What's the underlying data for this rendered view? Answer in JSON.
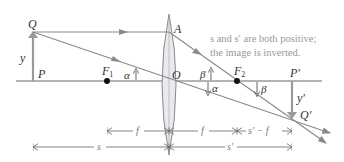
{
  "diagram": {
    "note_lines": [
      "s and s′ are both positive;",
      "the image is inverted."
    ],
    "points": {
      "Q": "Q",
      "P": "P",
      "F1": "F",
      "F1_sub": "1",
      "O": "O",
      "A": "A",
      "F2": "F",
      "F2_sub": "2",
      "P_prime": "P′",
      "Q_prime": "Q′"
    },
    "heights": {
      "object": "y",
      "image": "y′"
    },
    "angles": {
      "alpha_left": "α",
      "beta_upper": "β",
      "alpha_right": "α",
      "beta_lower": "β"
    },
    "dimensions": {
      "row1": [
        "f",
        "f",
        "s′ − f"
      ],
      "row2": [
        "s",
        "s′"
      ]
    },
    "colors": {
      "ray": "#8a8a8a",
      "axis": "#666666",
      "lens_fill": "#e9e9ee",
      "lens_stroke": "#8a8a8a",
      "arrow": "#9a9a9a",
      "note": "#9a9a9a"
    }
  }
}
